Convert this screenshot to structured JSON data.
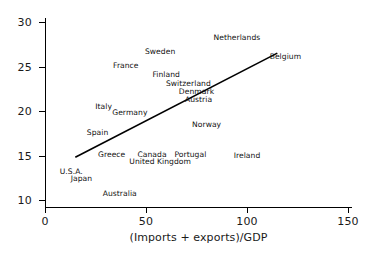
{
  "chart_data": {
    "type": "scatter",
    "title": "",
    "xlabel": "(Imports + exports)/GDP",
    "ylabel": "",
    "xlim": [
      0,
      150
    ],
    "ylim": [
      10,
      30
    ],
    "xticks": [
      0,
      50,
      100,
      150
    ],
    "yticks": [
      10,
      15,
      20,
      25,
      30
    ],
    "grid": false,
    "legend": null,
    "note": "Points are rendered as country name text labels only; no marker symbols are drawn.",
    "labels": [
      {
        "name": "Netherlands",
        "x": 95,
        "y": 28.2
      },
      {
        "name": "Sweden",
        "x": 57,
        "y": 26.6
      },
      {
        "name": "Belgium",
        "x": 119,
        "y": 26.1
      },
      {
        "name": "France",
        "x": 40,
        "y": 25.1
      },
      {
        "name": "Finland",
        "x": 60,
        "y": 24.1
      },
      {
        "name": "Switzerland",
        "x": 71,
        "y": 23.0
      },
      {
        "name": "Denmark",
        "x": 75,
        "y": 22.1
      },
      {
        "name": "Austria",
        "x": 76,
        "y": 21.2
      },
      {
        "name": "Italy",
        "x": 29,
        "y": 20.4
      },
      {
        "name": "Germany",
        "x": 42,
        "y": 19.8
      },
      {
        "name": "Norway",
        "x": 80,
        "y": 18.4
      },
      {
        "name": "Spain",
        "x": 26,
        "y": 17.5
      },
      {
        "name": "Greece",
        "x": 33,
        "y": 15.1
      },
      {
        "name": "Canada",
        "x": 53,
        "y": 15.1
      },
      {
        "name": "Portugal",
        "x": 72,
        "y": 15.1
      },
      {
        "name": "Ireland",
        "x": 100,
        "y": 15.0
      },
      {
        "name": "United Kingdom",
        "x": 57,
        "y": 14.3
      },
      {
        "name": "U.S.A.",
        "x": 13,
        "y": 13.2
      },
      {
        "name": "Japan",
        "x": 18,
        "y": 12.4
      },
      {
        "name": "Australia",
        "x": 37,
        "y": 10.7
      }
    ],
    "trend_line": {
      "x0": 15.0,
      "y0": 14.8,
      "x1": 115.0,
      "y1": 26.5,
      "color": "#000000",
      "width": 1.6
    },
    "axis_color": "#000000"
  },
  "axis": {
    "x_tick_labels": [
      "0",
      "50",
      "100",
      "150"
    ],
    "y_tick_labels": [
      "10",
      "15",
      "20",
      "25",
      "30"
    ],
    "x_title": "(Imports + exports)/GDP"
  }
}
